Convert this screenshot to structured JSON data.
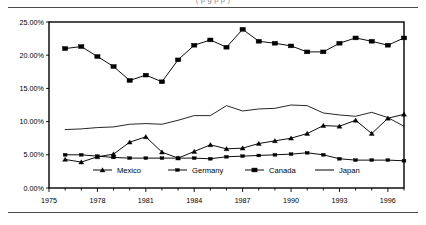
{
  "page": {
    "clipped_caption": "(   p          g                       p   p )"
  },
  "chart_data": {
    "type": "line",
    "title": "",
    "xlabel": "",
    "ylabel": "",
    "xlim": [
      1975,
      1997
    ],
    "ylim": [
      0,
      25
    ],
    "grid": false,
    "legend_position": "inside-bottom-center",
    "x_tick_labels": [
      "1975",
      "1978",
      "1981",
      "1984",
      "1987",
      "1990",
      "1993",
      "1996"
    ],
    "x_tick_values": [
      1975,
      1978,
      1981,
      1984,
      1987,
      1990,
      1993,
      1996
    ],
    "x_minor_ticks": [
      1976,
      1977,
      1979,
      1980,
      1982,
      1983,
      1985,
      1986,
      1988,
      1989,
      1991,
      1992,
      1994,
      1995,
      1997
    ],
    "y_tick_labels": [
      "0.00%",
      "5.00%",
      "10.00%",
      "15.00%",
      "20.00%",
      "25.00%"
    ],
    "y_tick_values": [
      0,
      5,
      10,
      15,
      20,
      25
    ],
    "x": [
      1976,
      1977,
      1978,
      1979,
      1980,
      1981,
      1982,
      1983,
      1984,
      1985,
      1986,
      1987,
      1988,
      1989,
      1990,
      1991,
      1992,
      1993,
      1994,
      1995,
      1996,
      1997
    ],
    "series": [
      {
        "name": "Mexico",
        "marker": "triangle",
        "color": "#000000",
        "values": [
          4.3,
          3.9,
          4.7,
          5.1,
          6.9,
          7.7,
          5.4,
          4.5,
          5.5,
          6.5,
          5.9,
          6.0,
          6.7,
          7.1,
          7.5,
          8.2,
          9.4,
          9.3,
          10.2,
          8.2,
          10.5,
          11.1
        ]
      },
      {
        "name": "Germany",
        "marker": "small-square",
        "color": "#000000",
        "values": [
          5.0,
          5.0,
          4.8,
          4.6,
          4.5,
          4.5,
          4.5,
          4.5,
          4.5,
          4.4,
          4.7,
          4.8,
          4.9,
          5.0,
          5.1,
          5.3,
          5.0,
          4.4,
          4.2,
          4.2,
          4.2,
          4.1
        ]
      },
      {
        "name": "Canada",
        "marker": "square",
        "color": "#000000",
        "values": [
          21.0,
          21.3,
          19.8,
          18.3,
          16.2,
          17.0,
          16.0,
          19.3,
          21.5,
          22.3,
          21.2,
          23.9,
          22.1,
          21.8,
          21.4,
          20.5,
          20.5,
          21.8,
          22.6,
          22.1,
          21.5,
          22.6
        ]
      },
      {
        "name": "Japan",
        "marker": "none",
        "color": "#000000",
        "values": [
          8.8,
          8.9,
          9.1,
          9.2,
          9.6,
          9.7,
          9.6,
          10.2,
          10.9,
          10.9,
          12.4,
          11.6,
          11.9,
          12.0,
          12.5,
          12.4,
          11.3,
          11.0,
          10.8,
          11.4,
          10.6,
          9.3
        ]
      }
    ]
  },
  "legend": {
    "items": [
      {
        "label": "Mexico"
      },
      {
        "label": "Germany"
      },
      {
        "label": "Canada"
      },
      {
        "label": "Japan"
      }
    ]
  }
}
